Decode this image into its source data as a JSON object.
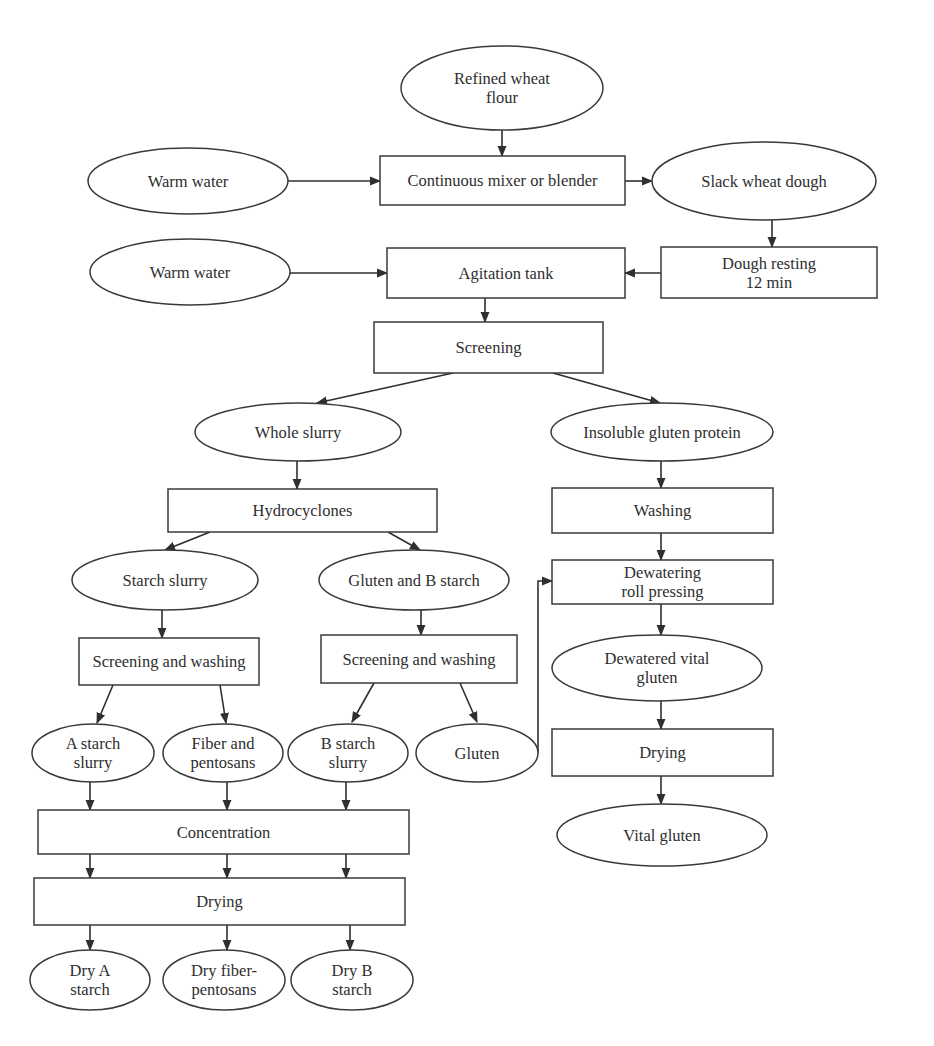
{
  "diagram": {
    "type": "flowchart",
    "colors": {
      "stroke": "#3a3a3a",
      "text": "#2e2e2e",
      "background": "#ffffff"
    },
    "nodes": [
      {
        "id": "refined_flour",
        "shape": "ellipse",
        "lines": [
          "Refined wheat",
          "flour"
        ],
        "cx": 502,
        "cy": 88,
        "rx": 101,
        "ry": 42
      },
      {
        "id": "warm_water_1",
        "shape": "ellipse",
        "lines": [
          "Warm water"
        ],
        "cx": 188,
        "cy": 181,
        "rx": 100,
        "ry": 33
      },
      {
        "id": "mixer",
        "shape": "rect",
        "lines": [
          "Continuous mixer or blender"
        ],
        "x": 380,
        "y": 156,
        "w": 245,
        "h": 49
      },
      {
        "id": "slack_dough",
        "shape": "ellipse",
        "lines": [
          "Slack wheat dough"
        ],
        "cx": 764,
        "cy": 181,
        "rx": 112,
        "ry": 39
      },
      {
        "id": "warm_water_2",
        "shape": "ellipse",
        "lines": [
          "Warm water"
        ],
        "cx": 190,
        "cy": 272,
        "rx": 100,
        "ry": 33
      },
      {
        "id": "agitation_tank",
        "shape": "rect",
        "lines": [
          "Agitation tank"
        ],
        "x": 387,
        "y": 248,
        "w": 238,
        "h": 50
      },
      {
        "id": "dough_resting",
        "shape": "rect",
        "lines": [
          "Dough resting",
          "12 min"
        ],
        "x": 661,
        "y": 247,
        "w": 216,
        "h": 51
      },
      {
        "id": "screening",
        "shape": "rect",
        "lines": [
          "Screening"
        ],
        "x": 374,
        "y": 322,
        "w": 229,
        "h": 51
      },
      {
        "id": "whole_slurry",
        "shape": "ellipse",
        "lines": [
          "Whole slurry"
        ],
        "cx": 298,
        "cy": 432,
        "rx": 103,
        "ry": 29
      },
      {
        "id": "insoluble_gluten",
        "shape": "ellipse",
        "lines": [
          "Insoluble gluten protein"
        ],
        "cx": 662,
        "cy": 432,
        "rx": 111,
        "ry": 29
      },
      {
        "id": "hydrocyclones",
        "shape": "rect",
        "lines": [
          "Hydrocyclones"
        ],
        "x": 168,
        "y": 489,
        "w": 269,
        "h": 43
      },
      {
        "id": "washing",
        "shape": "rect",
        "lines": [
          "Washing"
        ],
        "x": 552,
        "y": 488,
        "w": 221,
        "h": 45
      },
      {
        "id": "starch_slurry",
        "shape": "ellipse",
        "lines": [
          "Starch slurry"
        ],
        "cx": 165,
        "cy": 580,
        "rx": 93,
        "ry": 30
      },
      {
        "id": "gluten_b_starch",
        "shape": "ellipse",
        "lines": [
          "Gluten and B starch"
        ],
        "cx": 414,
        "cy": 580,
        "rx": 95,
        "ry": 30
      },
      {
        "id": "dewatering",
        "shape": "rect",
        "lines": [
          "Dewatering",
          "roll pressing"
        ],
        "x": 552,
        "y": 560,
        "w": 221,
        "h": 44
      },
      {
        "id": "sw_left",
        "shape": "rect",
        "lines": [
          "Screening and washing"
        ],
        "x": 79,
        "y": 638,
        "w": 180,
        "h": 47
      },
      {
        "id": "sw_right",
        "shape": "rect",
        "lines": [
          "Screening and washing"
        ],
        "x": 321,
        "y": 635,
        "w": 196,
        "h": 48
      },
      {
        "id": "dewatered_gluten",
        "shape": "ellipse",
        "lines": [
          "Dewatered vital",
          "gluten"
        ],
        "cx": 657,
        "cy": 668,
        "rx": 105,
        "ry": 33
      },
      {
        "id": "a_starch_slurry",
        "shape": "ellipse",
        "lines": [
          "A starch",
          "slurry"
        ],
        "cx": 93,
        "cy": 753,
        "rx": 61,
        "ry": 29
      },
      {
        "id": "fiber_pentosans",
        "shape": "ellipse",
        "lines": [
          "Fiber and",
          "pentosans"
        ],
        "cx": 223,
        "cy": 753,
        "rx": 60,
        "ry": 29
      },
      {
        "id": "b_starch_slurry",
        "shape": "ellipse",
        "lines": [
          "B starch",
          "slurry"
        ],
        "cx": 348,
        "cy": 753,
        "rx": 60,
        "ry": 29
      },
      {
        "id": "gluten",
        "shape": "ellipse",
        "lines": [
          "Gluten"
        ],
        "cx": 477,
        "cy": 753,
        "rx": 61,
        "ry": 29
      },
      {
        "id": "drying_right",
        "shape": "rect",
        "lines": [
          "Drying"
        ],
        "x": 552,
        "y": 729,
        "w": 221,
        "h": 47
      },
      {
        "id": "concentration",
        "shape": "rect",
        "lines": [
          "Concentration"
        ],
        "x": 38,
        "y": 810,
        "w": 371,
        "h": 44
      },
      {
        "id": "vital_gluten",
        "shape": "ellipse",
        "lines": [
          "Vital gluten"
        ],
        "cx": 662,
        "cy": 835,
        "rx": 105,
        "ry": 31
      },
      {
        "id": "drying_left",
        "shape": "rect",
        "lines": [
          "Drying"
        ],
        "x": 34,
        "y": 878,
        "w": 371,
        "h": 47
      },
      {
        "id": "dry_a_starch",
        "shape": "ellipse",
        "lines": [
          "Dry A",
          "starch"
        ],
        "cx": 90,
        "cy": 980,
        "rx": 60,
        "ry": 30
      },
      {
        "id": "dry_fiber_pentosans",
        "shape": "ellipse",
        "lines": [
          "Dry fiber-",
          "pentosans"
        ],
        "cx": 224,
        "cy": 980,
        "rx": 61,
        "ry": 30
      },
      {
        "id": "dry_b_starch",
        "shape": "ellipse",
        "lines": [
          "Dry B",
          "starch"
        ],
        "cx": 352,
        "cy": 980,
        "rx": 61,
        "ry": 30
      }
    ],
    "edges": [
      {
        "from": "refined_flour",
        "to": "mixer",
        "points": [
          [
            502,
            130
          ],
          [
            502,
            156
          ]
        ]
      },
      {
        "from": "warm_water_1",
        "to": "mixer",
        "points": [
          [
            288,
            181
          ],
          [
            380,
            181
          ]
        ]
      },
      {
        "from": "mixer",
        "to": "slack_dough",
        "points": [
          [
            625,
            181
          ],
          [
            652,
            181
          ]
        ]
      },
      {
        "from": "slack_dough",
        "to": "dough_resting",
        "points": [
          [
            772,
            220
          ],
          [
            772,
            247
          ]
        ]
      },
      {
        "from": "warm_water_2",
        "to": "agitation_tank",
        "points": [
          [
            290,
            273
          ],
          [
            387,
            273
          ]
        ]
      },
      {
        "from": "dough_resting",
        "to": "agitation_tank",
        "points": [
          [
            661,
            273
          ],
          [
            625,
            273
          ]
        ]
      },
      {
        "from": "agitation_tank",
        "to": "screening",
        "points": [
          [
            485,
            298
          ],
          [
            485,
            322
          ]
        ]
      },
      {
        "from": "screening",
        "to": "whole_slurry",
        "points": [
          [
            453,
            373
          ],
          [
            317,
            403
          ]
        ]
      },
      {
        "from": "screening",
        "to": "insoluble_gluten",
        "points": [
          [
            553,
            373
          ],
          [
            660,
            403
          ]
        ]
      },
      {
        "from": "whole_slurry",
        "to": "hydrocyclones",
        "points": [
          [
            297,
            461
          ],
          [
            297,
            489
          ]
        ]
      },
      {
        "from": "insoluble_gluten",
        "to": "washing",
        "points": [
          [
            661,
            461
          ],
          [
            661,
            488
          ]
        ]
      },
      {
        "from": "hydrocyclones",
        "to": "starch_slurry",
        "points": [
          [
            210,
            532
          ],
          [
            165,
            550
          ]
        ]
      },
      {
        "from": "hydrocyclones",
        "to": "gluten_b_starch",
        "points": [
          [
            388,
            532
          ],
          [
            420,
            550
          ]
        ]
      },
      {
        "from": "washing",
        "to": "dewatering",
        "points": [
          [
            661,
            533
          ],
          [
            661,
            560
          ]
        ]
      },
      {
        "from": "starch_slurry",
        "to": "sw_left",
        "points": [
          [
            162,
            610
          ],
          [
            162,
            638
          ]
        ]
      },
      {
        "from": "gluten_b_starch",
        "to": "sw_right",
        "points": [
          [
            421,
            610
          ],
          [
            421,
            635
          ]
        ]
      },
      {
        "from": "gluten",
        "to": "dewatering",
        "points": [
          [
            538,
            753
          ],
          [
            538,
            581
          ],
          [
            552,
            581
          ]
        ]
      },
      {
        "from": "dewatering",
        "to": "dewatered_gluten",
        "points": [
          [
            661,
            604
          ],
          [
            661,
            635
          ]
        ]
      },
      {
        "from": "sw_left",
        "to": "a_starch_slurry",
        "points": [
          [
            113,
            685
          ],
          [
            97,
            723
          ]
        ]
      },
      {
        "from": "sw_left",
        "to": "fiber_pentosans",
        "points": [
          [
            220,
            685
          ],
          [
            226,
            723
          ]
        ]
      },
      {
        "from": "sw_right",
        "to": "b_starch_slurry",
        "points": [
          [
            374,
            683
          ],
          [
            352,
            722
          ]
        ]
      },
      {
        "from": "sw_right",
        "to": "gluten",
        "points": [
          [
            460,
            683
          ],
          [
            477,
            722
          ]
        ]
      },
      {
        "from": "dewatered_gluten",
        "to": "drying_right",
        "points": [
          [
            661,
            701
          ],
          [
            661,
            729
          ]
        ]
      },
      {
        "from": "drying_right",
        "to": "vital_gluten",
        "points": [
          [
            661,
            776
          ],
          [
            661,
            804
          ]
        ]
      },
      {
        "from": "a_starch_slurry",
        "to": "concentration",
        "points": [
          [
            90,
            782
          ],
          [
            90,
            810
          ]
        ]
      },
      {
        "from": "fiber_pentosans",
        "to": "concentration",
        "points": [
          [
            227,
            782
          ],
          [
            227,
            810
          ]
        ]
      },
      {
        "from": "b_starch_slurry",
        "to": "concentration",
        "points": [
          [
            346,
            782
          ],
          [
            346,
            810
          ]
        ]
      },
      {
        "from": "concentration",
        "to": "drying_left",
        "points": [
          [
            90,
            854
          ],
          [
            90,
            878
          ]
        ]
      },
      {
        "from": "concentration",
        "to": "drying_left",
        "points": [
          [
            227,
            854
          ],
          [
            227,
            878
          ]
        ]
      },
      {
        "from": "concentration",
        "to": "drying_left",
        "points": [
          [
            346,
            854
          ],
          [
            346,
            878
          ]
        ]
      },
      {
        "from": "drying_left",
        "to": "dry_a_starch",
        "points": [
          [
            90,
            925
          ],
          [
            90,
            950
          ]
        ]
      },
      {
        "from": "drying_left",
        "to": "dry_fiber_pentosans",
        "points": [
          [
            227,
            925
          ],
          [
            227,
            950
          ]
        ]
      },
      {
        "from": "drying_left",
        "to": "dry_b_starch",
        "points": [
          [
            350,
            925
          ],
          [
            350,
            950
          ]
        ]
      }
    ]
  }
}
